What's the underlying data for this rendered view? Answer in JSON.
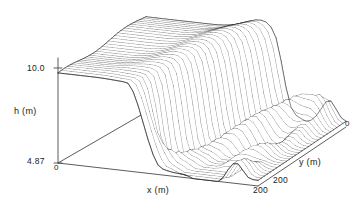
{
  "figure": {
    "type": "3d-wireframe-surface",
    "background_color": "#ffffff",
    "line_color": "#1a1a1a"
  },
  "axes": {
    "h": {
      "title": "h (m)",
      "ticks": [
        "10.0",
        "4.87"
      ],
      "origin_label": "0",
      "min": 4.87,
      "max": 10.0,
      "unit": "m"
    },
    "x": {
      "title": "x (m)",
      "ticks": [
        "0",
        "200"
      ],
      "min": 0,
      "max": 200,
      "unit": "m"
    },
    "y": {
      "title": "y (m)",
      "ticks": [
        "200",
        "0"
      ],
      "min": 0,
      "max": 200,
      "unit": "m"
    }
  },
  "chart_data": {
    "type": "surface",
    "title": "",
    "subtitle": "",
    "xlabel": "x (m)",
    "ylabel": "y (m)",
    "zlabel": "h (m)",
    "xlim": [
      0,
      200
    ],
    "ylim": [
      0,
      200
    ],
    "zlim": [
      4.87,
      10.0
    ],
    "xtick_labels": [
      "0",
      "200"
    ],
    "ytick_labels": [
      "200",
      "0"
    ],
    "ztick_labels": [
      "4.87",
      "10.0"
    ],
    "grid": false,
    "legend": "none",
    "projection": "isometric-wireframe",
    "mesh_nx": 41,
    "mesh_ny": 29,
    "surface_features": [
      "flat elevated plateau across the upper-left quadrant at h near 10.0",
      "steep narrow channel cutting diagonally through the centre of the domain",
      "series of rolling dune-like crests and troughs across the right half",
      "low flat apron along the lower-right margin"
    ],
    "annotations": []
  }
}
